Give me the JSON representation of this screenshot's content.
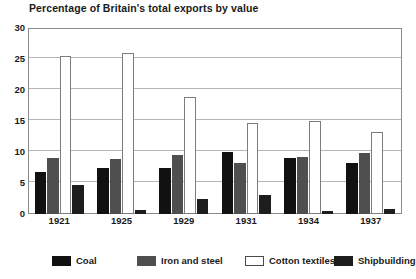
{
  "chart_data": {
    "type": "bar",
    "title": "Percentage of Britain's total exports by value",
    "xlabel": "",
    "ylabel": "",
    "ylim": [
      0,
      30
    ],
    "ytick_step": 5,
    "yticks": [
      30,
      25,
      20,
      15,
      10,
      5,
      0
    ],
    "grid": true,
    "legend_position": "bottom",
    "categories": [
      "1921",
      "1925",
      "1929",
      "1931",
      "1934",
      "1937"
    ],
    "series": [
      {
        "name": "Coal",
        "color": "#111111",
        "values": [
          6.8,
          7.5,
          7.4,
          10.0,
          9.1,
          8.2
        ]
      },
      {
        "name": "Iron and steel",
        "color": "#4f4f4f",
        "values": [
          9.0,
          8.8,
          9.5,
          8.2,
          9.2,
          9.8
        ]
      },
      {
        "name": "Cotton textiles",
        "color": "#ffffff",
        "values": [
          25.5,
          26.0,
          18.9,
          14.6,
          15.0,
          13.2
        ]
      },
      {
        "name": "Shipbuilding",
        "color": "#1d1d1d",
        "values": [
          4.7,
          0.7,
          2.4,
          3.0,
          0.5,
          0.8
        ]
      }
    ]
  }
}
